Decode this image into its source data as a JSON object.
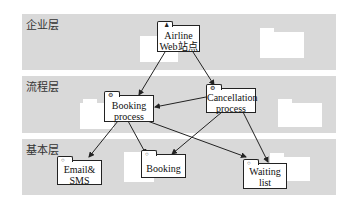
{
  "layers": [
    {
      "label": "企业层",
      "top": 14,
      "height": 56
    },
    {
      "label": "流程层",
      "top": 76,
      "height": 57
    },
    {
      "label": "基本层",
      "top": 139,
      "height": 56
    }
  ],
  "nodes": {
    "airline": {
      "line1": "Airline",
      "line2": "Web站点"
    },
    "booking_process": {
      "line1": "Booking",
      "line2": "process"
    },
    "cancellation_process": {
      "line1": "Cancellation",
      "line2": "process"
    },
    "email_sms": {
      "line1": "Email&",
      "line2": "SMS"
    },
    "booking": {
      "line1": "Booking"
    },
    "waiting_list": {
      "line1": "Waiting",
      "line2": "list"
    }
  },
  "edges": [
    {
      "from": "airline",
      "to": "booking_process"
    },
    {
      "from": "airline",
      "to": "cancellation_process"
    },
    {
      "from": "cancellation_process",
      "to": "booking_process"
    },
    {
      "from": "booking_process",
      "to": "email_sms"
    },
    {
      "from": "booking_process",
      "to": "booking"
    },
    {
      "from": "booking_process",
      "to": "waiting_list"
    },
    {
      "from": "cancellation_process",
      "to": "booking"
    },
    {
      "from": "cancellation_process",
      "to": "waiting_list"
    }
  ],
  "colors": {
    "band": "#d9d9d9",
    "node_border": "#222222",
    "node_fill": "#ffffff"
  }
}
